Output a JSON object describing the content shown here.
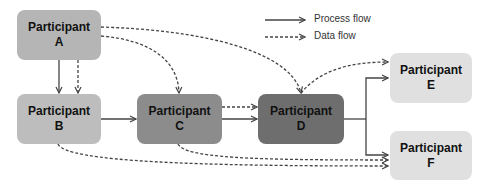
{
  "legend": {
    "process_flow": "Process flow",
    "data_flow": "Data flow"
  },
  "nodes": {
    "a": {
      "title": "Participant",
      "letter": "A",
      "color": "#b5b5b5"
    },
    "b": {
      "title": "Participant",
      "letter": "B",
      "color": "#bdbdbd"
    },
    "c": {
      "title": "Participant",
      "letter": "C",
      "color": "#8c8c8c"
    },
    "d": {
      "title": "Participant",
      "letter": "D",
      "color": "#6e6e6e"
    },
    "e": {
      "title": "Participant",
      "letter": "E",
      "color": "#e0e0e0"
    },
    "f": {
      "title": "Participant",
      "letter": "F",
      "color": "#e0e0e0"
    }
  },
  "edges": [
    {
      "from": "A",
      "to": "B",
      "type": "process"
    },
    {
      "from": "A",
      "to": "B",
      "type": "data"
    },
    {
      "from": "A",
      "to": "C",
      "type": "data"
    },
    {
      "from": "A",
      "to": "D",
      "type": "data"
    },
    {
      "from": "B",
      "to": "C",
      "type": "process"
    },
    {
      "from": "B",
      "to": "F",
      "type": "data"
    },
    {
      "from": "C",
      "to": "D",
      "type": "process"
    },
    {
      "from": "C",
      "to": "D",
      "type": "data"
    },
    {
      "from": "C",
      "to": "F",
      "type": "data"
    },
    {
      "from": "D",
      "to": "E",
      "type": "process"
    },
    {
      "from": "D",
      "to": "E",
      "type": "data"
    },
    {
      "from": "D",
      "to": "F",
      "type": "process"
    }
  ]
}
